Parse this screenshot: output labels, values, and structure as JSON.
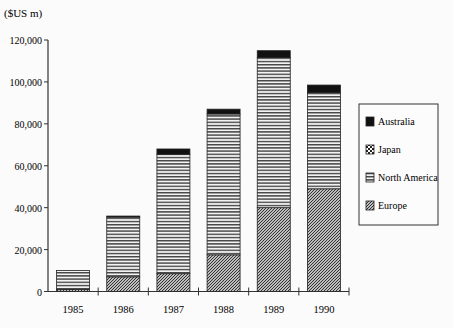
{
  "chart_data": {
    "type": "bar",
    "stacked": true,
    "title": "",
    "ylabel": "($US m)",
    "xlabel": "",
    "categories": [
      "1985",
      "1986",
      "1987",
      "1988",
      "1989",
      "1990"
    ],
    "ylim": [
      0,
      120000
    ],
    "yticks": [
      0,
      20000,
      40000,
      60000,
      80000,
      100000,
      120000
    ],
    "ytick_labels": [
      "0",
      "20,000",
      "40,000",
      "60,000",
      "80,000",
      "100,000",
      "120,000"
    ],
    "grid": false,
    "legend_position": "right",
    "series": [
      {
        "name": "Europe",
        "pattern": "diagonal",
        "values": [
          1000,
          7000,
          8500,
          17500,
          40000,
          49000
        ]
      },
      {
        "name": "North America",
        "pattern": "horizontal",
        "values": [
          9000,
          28500,
          57000,
          67200,
          71700,
          45900
        ]
      },
      {
        "name": "Japan",
        "pattern": "checker",
        "values": [
          0,
          0,
          0,
          0,
          0,
          0
        ]
      },
      {
        "name": "Australia",
        "pattern": "solid",
        "values": [
          0,
          500,
          2500,
          2300,
          3200,
          3600
        ]
      }
    ],
    "legend": [
      "Australia",
      "Japan",
      "North America",
      "Europe"
    ]
  }
}
